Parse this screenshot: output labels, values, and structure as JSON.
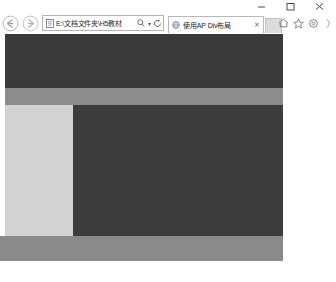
{
  "browser": {
    "name": "Internet Explorer",
    "window_controls": [
      {
        "name": "minimize",
        "glyph": "minimize-icon",
        "label": "Minimize"
      },
      {
        "name": "maximize",
        "glyph": "maximize-icon",
        "label": "Maximize"
      },
      {
        "name": "close",
        "glyph": "close-icon",
        "label": "Close"
      }
    ],
    "navigation": {
      "back": {
        "icon": "back-arrow-icon",
        "label": "Back"
      },
      "forward": {
        "icon": "forward-arrow-icon",
        "label": "Forward"
      }
    },
    "address_bar": {
      "favicon": "page-icon",
      "value": "E:\\文档文件夹\\H5教材",
      "placeholder": "",
      "search_icon": "search-icon",
      "dropdown_caret": "▾",
      "refresh_icon": "refresh-icon",
      "refresh_glyph": "⟳"
    },
    "tabs": [
      {
        "favicon": "globe-icon",
        "title": "使用AP Div布局",
        "close_glyph": "✕",
        "active": true
      }
    ],
    "new_tab_label": "",
    "toolbar_right": [
      {
        "name": "home-icon",
        "label": "Home",
        "glyph": "⌂"
      },
      {
        "name": "favorites-star-icon",
        "label": "Favorites",
        "glyph": "☆"
      },
      {
        "name": "tools-gear-icon",
        "label": "Tools",
        "glyph": "⚙"
      },
      {
        "name": "overflow-icon",
        "label": "More",
        "glyph": "›"
      }
    ]
  },
  "page": {
    "title": "使用AP Div布局",
    "background": "#ffffff",
    "layout_blocks": [
      {
        "id": "apDiv1",
        "role": "header-banner",
        "color": "#3a3a3a",
        "x": 5,
        "y": 1,
        "w": 278,
        "h": 54
      },
      {
        "id": "apDiv2",
        "role": "nav-band",
        "color": "#8c8c8c",
        "x": 5,
        "y": 55,
        "w": 278,
        "h": 17
      },
      {
        "id": "apDiv3",
        "role": "sidebar",
        "color": "#d2d2d2",
        "x": 5,
        "y": 72,
        "w": 68,
        "h": 131
      },
      {
        "id": "apDiv4",
        "role": "main-content",
        "color": "#3d3d3d",
        "x": 73,
        "y": 72,
        "w": 210,
        "h": 131
      },
      {
        "id": "apDiv5",
        "role": "footer-band",
        "color": "#8a8a8a",
        "x": 0,
        "y": 203,
        "w": 283,
        "h": 25
      }
    ]
  }
}
